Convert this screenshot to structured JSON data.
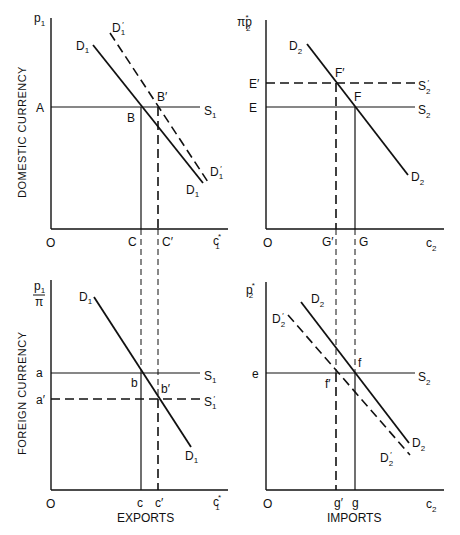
{
  "figure": {
    "panels": {
      "top_left": {
        "y_axis_label": "p",
        "y_axis_sub": "1",
        "vertical_title": "DOMESTIC CURRENCY",
        "x_axis_label": "c",
        "x_axis_sub": "1",
        "x_axis_sup": "*",
        "origin": "O",
        "price_level": "A",
        "supply": {
          "name": "S",
          "sub": "1"
        },
        "demand": {
          "name": "D",
          "sub": "1"
        },
        "demand_shifted": {
          "name": "D",
          "sub": "1",
          "prime": "′"
        },
        "points": {
          "B": "B",
          "B_prime": "B′"
        },
        "quantities": {
          "C": "C",
          "C_prime": "C′"
        }
      },
      "top_right": {
        "y_axis_label": "πp",
        "y_axis_sub": "2",
        "y_axis_sup": "*",
        "x_axis_label": "c",
        "x_axis_sub": "2",
        "origin": "O",
        "price_levels": {
          "E": "E",
          "E_prime": "E′"
        },
        "supply": {
          "name": "S",
          "sub": "2"
        },
        "supply_shifted": {
          "name": "S",
          "sub": "2",
          "prime": "′"
        },
        "demand": {
          "name": "D",
          "sub": "2"
        },
        "points": {
          "F": "F",
          "F_prime": "F′"
        },
        "quantities": {
          "G": "G",
          "G_prime": "G′"
        }
      },
      "bottom_left": {
        "y_axis_num": "p",
        "y_axis_num_sub": "1",
        "y_axis_den": "π",
        "vertical_title": "FOREIGN CURRENCY",
        "x_axis_label": "c",
        "x_axis_sub": "1",
        "x_axis_sup": "*",
        "x_axis_title": "EXPORTS",
        "origin": "O",
        "price_levels": {
          "a": "a",
          "a_prime": "a′"
        },
        "supply": {
          "name": "S",
          "sub": "1"
        },
        "supply_shifted": {
          "name": "S",
          "sub": "1",
          "prime": "′"
        },
        "demand": {
          "name": "D",
          "sub": "1"
        },
        "points": {
          "b": "b",
          "b_prime": "b′"
        },
        "quantities": {
          "c": "c",
          "c_prime": "c′"
        }
      },
      "bottom_right": {
        "y_axis_label": "p",
        "y_axis_sub": "2",
        "y_axis_sup": "*",
        "x_axis_label": "c",
        "x_axis_sub": "2",
        "x_axis_title": "IMPORTS",
        "origin": "O",
        "price_level": "e",
        "supply": {
          "name": "S",
          "sub": "2"
        },
        "demand": {
          "name": "D",
          "sub": "2"
        },
        "demand_shifted": {
          "name": "D",
          "sub": "2",
          "prime": "′"
        },
        "points": {
          "f": "f",
          "f_prime": "f′"
        },
        "quantities": {
          "g": "g",
          "g_prime": "g′"
        }
      }
    }
  }
}
